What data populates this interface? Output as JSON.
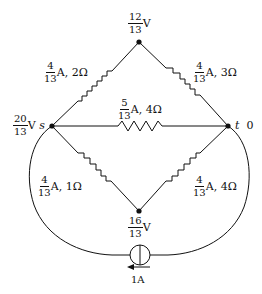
{
  "nodes": {
    "top": {
      "voltage_num": "12",
      "voltage_den": "13",
      "unit": "V"
    },
    "s": {
      "name": "s",
      "voltage_num": "20",
      "voltage_den": "13",
      "unit": "V"
    },
    "t": {
      "name": "t",
      "voltage": "0"
    },
    "bottom": {
      "voltage_num": "16",
      "voltage_den": "13",
      "unit": "V"
    }
  },
  "edges": {
    "s_top": {
      "current_num": "4",
      "current_den": "13",
      "suffix": "A, 2Ω"
    },
    "top_t": {
      "current_num": "4",
      "current_den": "13",
      "suffix": "A, 3Ω"
    },
    "s_t": {
      "current_num": "5",
      "current_den": "13",
      "suffix": "A, 4Ω"
    },
    "s_bottom": {
      "current_num": "4",
      "current_den": "13",
      "suffix": "A, 1Ω"
    },
    "bottom_t": {
      "current_num": "4",
      "current_den": "13",
      "suffix": "A, 4Ω"
    }
  },
  "source": {
    "label": "1A",
    "direction": "left"
  },
  "colors": {
    "stroke": "#111111",
    "background": "#ffffff"
  }
}
